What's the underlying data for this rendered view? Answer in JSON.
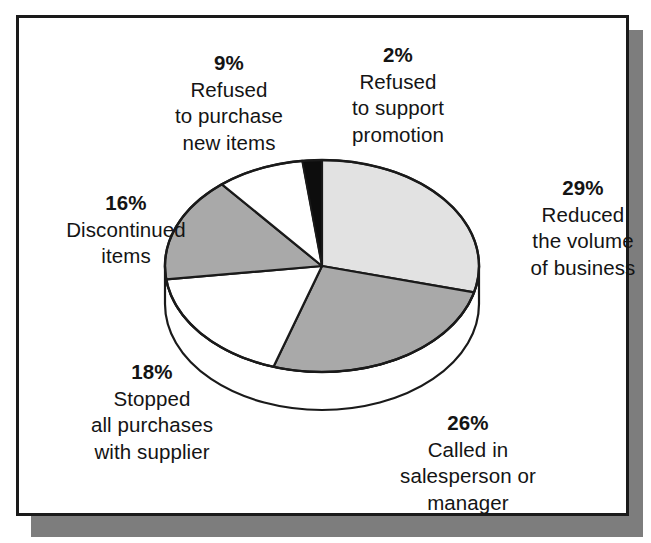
{
  "figure": {
    "kind": "pie-chart-figure",
    "frame_border_color": "#1a1a1a",
    "shadow_color": "#7d7d7d",
    "background_color": "#ffffff"
  },
  "chart_data": {
    "type": "pie",
    "title": "",
    "subtitle": "",
    "xlabel": "",
    "ylabel": "",
    "legend_position": "callout-labels",
    "grid": false,
    "units": "percent",
    "start_angle_deg": 0,
    "direction": "clockwise",
    "categories": [
      "Reduced the volume of business",
      "Called in salesperson or manager",
      "Stopped all purchases with supplier",
      "Discontinued items",
      "Refused to purchase new items",
      "Refused to support promotion"
    ],
    "values": [
      29,
      26,
      18,
      16,
      9,
      2
    ],
    "slices": [
      {
        "id": "reduced-volume",
        "percent_label": "29%",
        "value": 29,
        "lines": [
          "29%",
          "Reduced",
          "the volume",
          "of business"
        ],
        "color": "#e2e2e2"
      },
      {
        "id": "called-in",
        "percent_label": "26%",
        "value": 26,
        "lines": [
          "26%",
          "Called in",
          "salesperson or",
          "manager"
        ],
        "color": "#a9a9a9"
      },
      {
        "id": "stopped-purchases",
        "percent_label": "18%",
        "value": 18,
        "lines": [
          "18%",
          "Stopped",
          "all purchases",
          "with supplier"
        ],
        "color": "#ffffff"
      },
      {
        "id": "discontinued-items",
        "percent_label": "16%",
        "value": 16,
        "lines": [
          "16%",
          "Discontinued",
          "items"
        ],
        "color": "#a9a9a9"
      },
      {
        "id": "refused-new-items",
        "percent_label": "9%",
        "value": 9,
        "lines": [
          "9%",
          "Refused",
          "to purchase",
          "new items"
        ],
        "color": "#ffffff"
      },
      {
        "id": "refused-promotion",
        "percent_label": "2%",
        "value": 2,
        "lines": [
          "2%",
          "Refused",
          "to support",
          "promotion"
        ],
        "color": "#0d0d0d"
      }
    ]
  },
  "callouts": {
    "refused_new_items": {
      "l1": "9%",
      "l2": "Refused",
      "l3": "to purchase",
      "l4": "new items"
    },
    "refused_promotion": {
      "l1": "2%",
      "l2": "Refused",
      "l3": "to support",
      "l4": "promotion"
    },
    "reduced_volume": {
      "l1": "29%",
      "l2": "Reduced",
      "l3": "the volume",
      "l4": "of business"
    },
    "discontinued_items": {
      "l1": "16%",
      "l2": "Discontinued",
      "l3": "items"
    },
    "stopped_purchases": {
      "l1": "18%",
      "l2": "Stopped",
      "l3": "all purchases",
      "l4": "with supplier"
    },
    "called_in": {
      "l1": "26%",
      "l2": "Called in",
      "l3": "salesperson or",
      "l4": "manager"
    }
  }
}
